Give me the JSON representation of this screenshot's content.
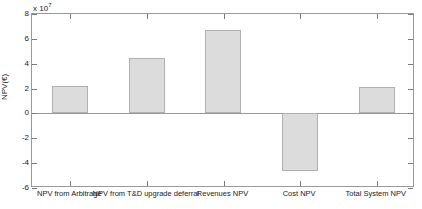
{
  "chart_data": {
    "type": "bar",
    "title": "",
    "xlabel": "",
    "ylabel": "NPV(€)",
    "y_exponent_label": "x 10",
    "y_exponent_value": "7",
    "categories": [
      "NPV from Arbitrage",
      "NPV from T&D upgrade deferral",
      "Revenues NPV",
      "Cost NPV",
      "Total System NPV"
    ],
    "values": [
      22000000,
      45000000,
      67000000,
      -46500000,
      21000000
    ],
    "values_scaled": [
      2.2,
      4.5,
      6.7,
      -4.65,
      2.1
    ],
    "ylim": [
      -6,
      8
    ],
    "ytick_labels": [
      "8",
      "6",
      "4",
      "2",
      "0",
      "-2",
      "-4",
      "-6"
    ],
    "ytick_values": [
      8,
      6,
      4,
      2,
      0,
      -2,
      -4,
      -6
    ],
    "grid": false,
    "legend": false,
    "bar_fill_color": "#dcdcdc",
    "bar_edge_color": "#b0b0b0",
    "axis_color": "#9a9a9a",
    "background_color": "#ffffff"
  }
}
